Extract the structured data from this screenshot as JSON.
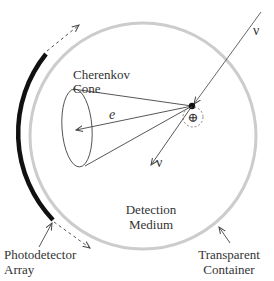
{
  "diagram": {
    "labels": {
      "cherenkov_line1": "Cherenkov",
      "cherenkov_line2": "Cone",
      "medium_line1": "Detection",
      "medium_line2": "Medium",
      "photodetector_line1": "Photodetector",
      "photodetector_line2": "Array",
      "container_line1": "Transparent",
      "container_line2": "Container",
      "electron": "e",
      "neutrino_in": "ν",
      "neutrino_out": "ν",
      "nucleus": "⊕"
    },
    "colors": {
      "container_stroke": "#cccccc",
      "detector_array": "#111111",
      "lines": "#444444",
      "text": "#333333"
    }
  }
}
